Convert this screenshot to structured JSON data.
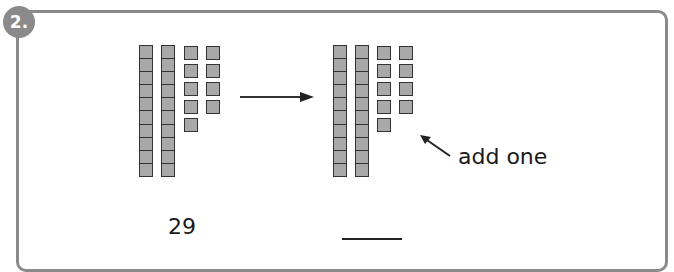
{
  "question": {
    "number_label": "2.",
    "badge_color": "#8a8a8a",
    "frame_color": "#8a8a8a"
  },
  "left_model": {
    "tens": 2,
    "ones_columns": [
      5,
      4
    ],
    "value_label": "29"
  },
  "right_model": {
    "tens": 2,
    "ones_columns": [
      5,
      4
    ],
    "answer_blank": ""
  },
  "annotation": {
    "text": "add one"
  },
  "colors": {
    "cube_fill": "#a9a9a9",
    "cube_border": "#333333"
  }
}
